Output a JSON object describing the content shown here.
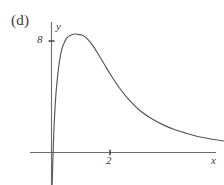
{
  "figure": {
    "panel_label": "(d)",
    "background_color": "#ffffff",
    "line_color": "#555555",
    "axis_color": "#666666"
  },
  "chart_data": {
    "type": "line",
    "title": "(d)",
    "xlabel": "x",
    "ylabel": "y",
    "grid": false,
    "legend": null,
    "xlim": [
      -0.55,
      7.7
    ],
    "ylim": [
      -2.4,
      11.2
    ],
    "xticks": [
      2
    ],
    "xtick_labels": [
      "2"
    ],
    "yticks": [
      8
    ],
    "ytick_labels": [
      "8"
    ],
    "annotations": [
      "curve rises steeply from below the x-axis near the origin",
      "peak near x = 1.05, y = 8.4",
      "long tail decaying toward the x-axis as x increases"
    ],
    "series": [
      {
        "name": "curve",
        "x": [
          0.02,
          0.05,
          0.08,
          0.12,
          0.16,
          0.2,
          0.25,
          0.3,
          0.35,
          0.4,
          0.5,
          0.6,
          0.7,
          0.8,
          0.9,
          1.0,
          1.05,
          1.2,
          1.4,
          1.6,
          1.8,
          2.0,
          2.3,
          2.6,
          3.0,
          3.4,
          3.8,
          4.2,
          4.6,
          5.0,
          5.5,
          6.0,
          6.5,
          7.0,
          7.6
        ],
        "y": [
          -2.4,
          -0.3,
          1.5,
          3.2,
          4.4,
          5.3,
          6.2,
          6.9,
          7.4,
          7.7,
          8.15,
          8.35,
          8.45,
          8.5,
          8.48,
          8.44,
          8.42,
          8.2,
          7.7,
          7.05,
          6.35,
          5.65,
          4.7,
          3.9,
          3.05,
          2.45,
          2.0,
          1.65,
          1.38,
          1.15,
          0.95,
          0.8,
          0.68,
          0.58,
          0.48
        ]
      }
    ]
  },
  "axes": {
    "y_label": "y",
    "x_label": "x",
    "y_tick_label": "8",
    "x_tick_label": "2"
  }
}
